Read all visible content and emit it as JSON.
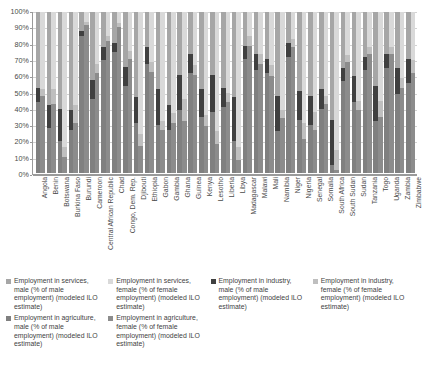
{
  "chart_data": {
    "type": "bar",
    "subtype": "100% stacked column, grouped male/female",
    "title": "",
    "xlabel": "",
    "ylabel": "",
    "ylim": [
      0,
      100
    ],
    "grid": true,
    "legend_position": "bottom",
    "ytick_labels": [
      "100%",
      "90%",
      "80%",
      "70%",
      "60%",
      "50%",
      "40%",
      "30%",
      "20%",
      "10%",
      "0%"
    ],
    "ytick_values": [
      100,
      90,
      80,
      70,
      60,
      50,
      40,
      30,
      20,
      10,
      0
    ],
    "categories": [
      "Angola",
      "Benin",
      "Botswana",
      "Burkina Faso",
      "Burundi",
      "Cameroon",
      "Central African Republic",
      "Chad",
      "Congo, Dem. Rep.",
      "Djibouti",
      "Ethiopia",
      "Gabon",
      "Gambia",
      "Ghana",
      "Guinea",
      "Kenya",
      "Lesotho",
      "Liberia",
      "Libya",
      "Madagascar",
      "Malawi",
      "Mali",
      "Namibia",
      "Niger",
      "Nigeria",
      "Senegal",
      "Somalia",
      "South Africa",
      "South Sudan",
      "Sudan",
      "Tanzania",
      "Togo",
      "Uganda",
      "Zambia",
      "Zimbabwe"
    ],
    "series": [
      {
        "name": "Employment in agriculture, male (% of male employment) (modeled ILO estimate)",
        "key": "agriculture_male",
        "color": "#808080",
        "values": [
          44,
          28,
          20,
          27,
          85,
          46,
          70,
          75,
          54,
          31,
          68,
          30,
          27,
          39,
          62,
          35,
          38,
          41,
          20,
          71,
          64,
          62,
          26,
          72,
          33,
          30,
          40,
          5,
          57,
          44,
          64,
          32,
          65,
          49,
          56
        ]
      },
      {
        "name": "Employment in agriculture, female (% of female employment) (modeled ILO estimate)",
        "key": "agriculture_female",
        "color": "#8c8c8c",
        "values": [
          48,
          43,
          10,
          31,
          92,
          62,
          82,
          91,
          71,
          17,
          63,
          27,
          31,
          32,
          61,
          29,
          18,
          44,
          8,
          79,
          68,
          60,
          34,
          78,
          21,
          27,
          43,
          2,
          69,
          39,
          74,
          35,
          74,
          53,
          62
        ]
      },
      {
        "name": "Employment in industry, male (% of male employment) (modeled ILO estimate)",
        "key": "industry_male",
        "color": "#404040",
        "values": [
          9,
          14,
          20,
          12,
          3,
          12,
          8,
          6,
          12,
          16,
          10,
          22,
          15,
          22,
          12,
          17,
          23,
          12,
          27,
          8,
          10,
          9,
          22,
          9,
          18,
          18,
          12,
          28,
          8,
          16,
          8,
          22,
          9,
          16,
          15
        ]
      },
      {
        "name": "Employment in industry, female (% of female employment) (modeled ILO estimate)",
        "key": "industry_female",
        "color": "#bfbfbf",
        "values": [
          4,
          9,
          6,
          11,
          2,
          6,
          3,
          2,
          5,
          7,
          6,
          5,
          6,
          14,
          6,
          7,
          8,
          6,
          8,
          6,
          6,
          7,
          5,
          5,
          10,
          11,
          5,
          12,
          4,
          6,
          4,
          10,
          4,
          6,
          8
        ]
      },
      {
        "name": "Employment in services, male (% of male employment) (modeled ILO estimate)",
        "key": "services_male",
        "color": "#a6a6a6",
        "values": [
          47,
          58,
          60,
          61,
          12,
          42,
          22,
          19,
          34,
          53,
          22,
          48,
          58,
          39,
          26,
          48,
          39,
          47,
          53,
          21,
          26,
          29,
          52,
          19,
          49,
          52,
          48,
          67,
          35,
          40,
          28,
          46,
          26,
          35,
          29
        ]
      },
      {
        "name": "Employment in services, female (% of female employment) (modeled ILO estimate)",
        "key": "services_female",
        "color": "#d9d9d9",
        "values": [
          48,
          48,
          84,
          58,
          6,
          32,
          15,
          7,
          24,
          76,
          31,
          68,
          63,
          54,
          33,
          64,
          74,
          50,
          84,
          15,
          26,
          33,
          61,
          17,
          69,
          62,
          52,
          86,
          27,
          55,
          22,
          55,
          22,
          41,
          30
        ]
      }
    ]
  },
  "legend": {
    "items": [
      {
        "label": "Employment in services, male (% of male employment) (modeled ILO estimate)",
        "color": "#a6a6a6",
        "swatch_name": "legend-swatch-services-male"
      },
      {
        "label": "Employment in services, female (% of female employment) (modeled ILO estimate)",
        "color": "#d9d9d9",
        "swatch_name": "legend-swatch-services-female"
      },
      {
        "label": "Employment in industry, male (% of male employment) (modeled ILO estimate)",
        "color": "#404040",
        "swatch_name": "legend-swatch-industry-male"
      },
      {
        "label": "Employment in industry, female (% of female employment) (modeled ILO estimate)",
        "color": "#bfbfbf",
        "swatch_name": "legend-swatch-industry-female"
      },
      {
        "label": "Employment in agriculture, male (% of male employment) (modeled ILO estimate)",
        "color": "#808080",
        "swatch_name": "legend-swatch-agriculture-male"
      },
      {
        "label": "Employment in agriculture, female (% of female employment) (modeled ILO estimate)",
        "color": "#8c8c8c",
        "swatch_name": "legend-swatch-agriculture-female"
      }
    ]
  }
}
